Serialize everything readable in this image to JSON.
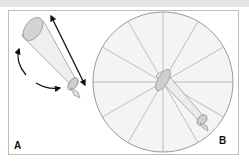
{
  "figure": {
    "panels": [
      {
        "id": "A",
        "label": "A",
        "description": "Cone-shaped instrument with curved rotation arrows and straight double-headed length arrow"
      },
      {
        "id": "B",
        "label": "B",
        "description": "Circle divided into 12 equal sectors with cone instrument positioned at center"
      }
    ],
    "circle_sectors": 12,
    "colors": {
      "frame": "#bdbdbd",
      "sector_lines": "#b0b0b0",
      "circle_fill": "#f2f2f2",
      "cone_fill": "#ececec",
      "cone_end": "#cfcfcf",
      "arrow": "#111111"
    }
  }
}
